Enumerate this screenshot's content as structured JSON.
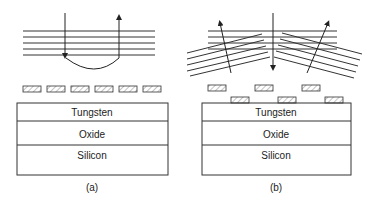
{
  "panels": [
    {
      "caption": "(a)",
      "layers": [
        "Tungsten",
        "Oxide",
        "Silicon"
      ],
      "description": "Parallel horizontal lines with incident ray reflecting back; single row of six hatched blocks"
    },
    {
      "caption": "(b)",
      "layers": [
        "Tungsten",
        "Oxide",
        "Silicon"
      ],
      "description": "Horizontal lines plus tilted lines on both sides; diffracted rays at angles; staggered two-row hatched blocks"
    }
  ],
  "colors": {
    "line": "#222222",
    "background": "#ffffff",
    "hatch": "#888888"
  }
}
